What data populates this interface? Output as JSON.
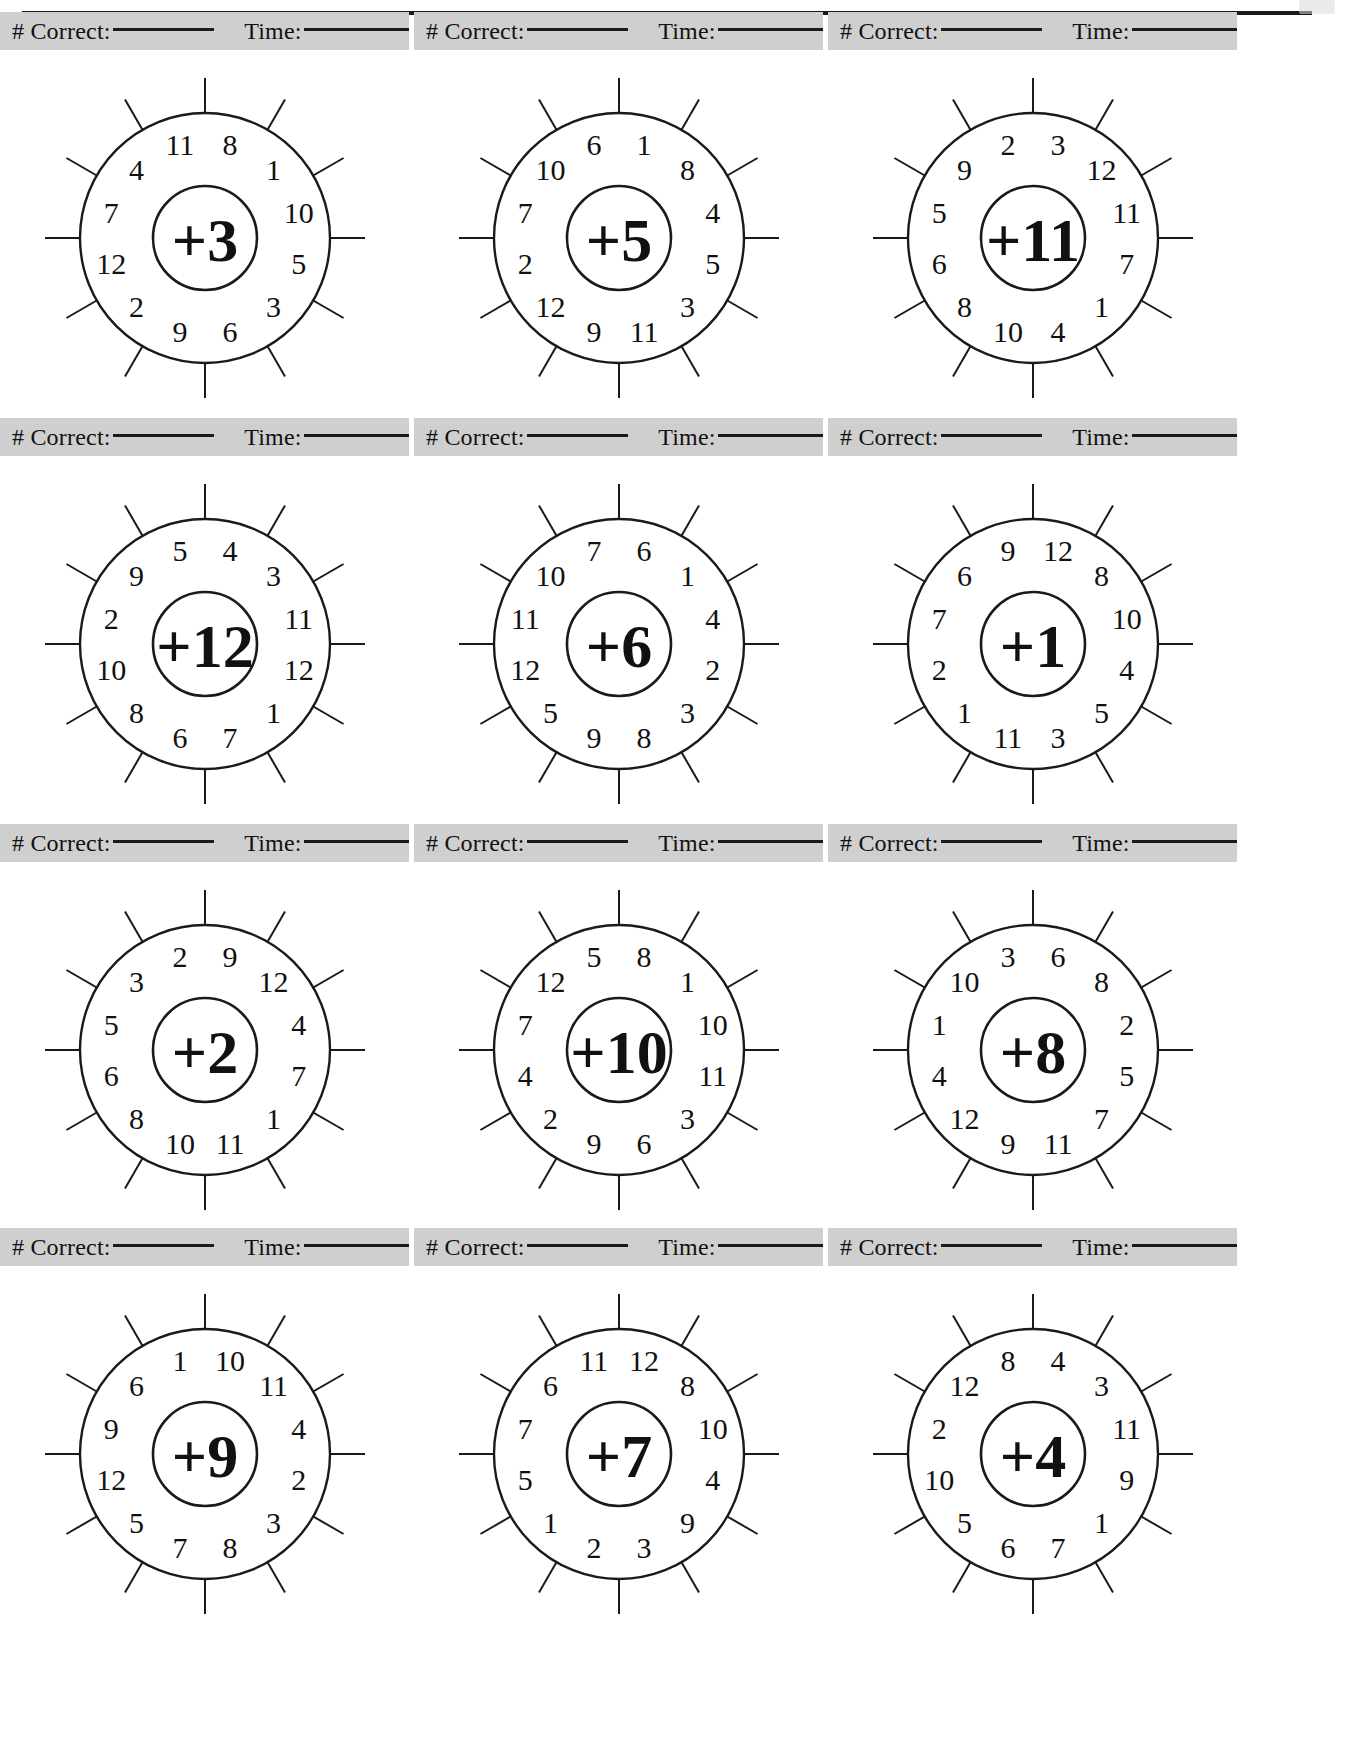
{
  "page": {
    "type": "math-worksheet",
    "title_visible": false,
    "top_rule": true,
    "grid": {
      "columns": 3,
      "rows": 4
    },
    "strip_bg_color": "#cfcfcf",
    "ink_color": "#1a1a1a"
  },
  "score_strip": {
    "correct_label": "# Correct:",
    "time_label": "Time:",
    "correct_value": "",
    "time_value": ""
  },
  "chart_data": {
    "type": "table",
    "segment_count": 12,
    "segment_order": "clockwise-from-top",
    "wheels": [
      {
        "id": 1,
        "hub": "+3",
        "segments": [
          8,
          1,
          10,
          5,
          3,
          6,
          9,
          2,
          12,
          7,
          4,
          11
        ]
      },
      {
        "id": 2,
        "hub": "+5",
        "segments": [
          1,
          8,
          4,
          5,
          3,
          11,
          9,
          12,
          2,
          7,
          10,
          6
        ]
      },
      {
        "id": 3,
        "hub": "+11",
        "segments": [
          3,
          12,
          11,
          7,
          1,
          4,
          10,
          8,
          6,
          5,
          9,
          2
        ]
      },
      {
        "id": 4,
        "hub": "+12",
        "segments": [
          4,
          3,
          11,
          12,
          1,
          7,
          6,
          8,
          10,
          2,
          9,
          5
        ]
      },
      {
        "id": 5,
        "hub": "+6",
        "segments": [
          6,
          1,
          4,
          2,
          3,
          8,
          9,
          5,
          12,
          11,
          10,
          7
        ]
      },
      {
        "id": 6,
        "hub": "+1",
        "segments": [
          12,
          8,
          10,
          4,
          5,
          3,
          11,
          1,
          2,
          7,
          6,
          9
        ]
      },
      {
        "id": 7,
        "hub": "+2",
        "segments": [
          9,
          12,
          4,
          7,
          1,
          11,
          10,
          8,
          6,
          5,
          3,
          2
        ]
      },
      {
        "id": 8,
        "hub": "+10",
        "segments": [
          8,
          1,
          10,
          11,
          3,
          6,
          9,
          2,
          4,
          7,
          12,
          5
        ]
      },
      {
        "id": 9,
        "hub": "+8",
        "segments": [
          6,
          8,
          2,
          5,
          7,
          11,
          9,
          12,
          4,
          1,
          10,
          3
        ]
      },
      {
        "id": 10,
        "hub": "+9",
        "segments": [
          10,
          11,
          4,
          2,
          3,
          8,
          7,
          5,
          12,
          9,
          6,
          1
        ]
      },
      {
        "id": 11,
        "hub": "+7",
        "segments": [
          12,
          8,
          10,
          4,
          9,
          3,
          2,
          1,
          5,
          7,
          6,
          11
        ]
      },
      {
        "id": 12,
        "hub": "+4",
        "segments": [
          4,
          3,
          11,
          9,
          1,
          7,
          6,
          5,
          10,
          2,
          12,
          8
        ]
      }
    ]
  }
}
